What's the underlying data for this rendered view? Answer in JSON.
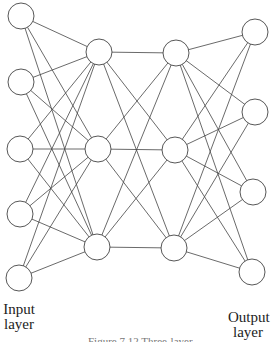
{
  "diagram": {
    "type": "feedforward-neural-network",
    "line_color": "#444444",
    "node_fill": "#ffffff",
    "node_radius": 13,
    "layers": [
      {
        "name": "input",
        "nodes": [
          [
            21,
            16
          ],
          [
            21,
            82
          ],
          [
            20,
            149
          ],
          [
            20,
            214
          ],
          [
            19,
            278
          ]
        ]
      },
      {
        "name": "hidden-1",
        "nodes": [
          [
            99,
            52
          ],
          [
            98,
            149
          ],
          [
            97,
            247
          ]
        ]
      },
      {
        "name": "hidden-2",
        "nodes": [
          [
            176,
            53
          ],
          [
            175,
            150
          ],
          [
            174,
            248
          ]
        ]
      },
      {
        "name": "output",
        "nodes": [
          [
            255,
            32
          ],
          [
            255,
            112
          ],
          [
            253,
            192
          ],
          [
            252,
            272
          ]
        ]
      }
    ]
  },
  "labels": {
    "input_line1": "Input",
    "input_line2": "layer",
    "output_line1": "Output",
    "output_line2": "layer"
  },
  "caption": "Figure 7.12 Three-layer"
}
